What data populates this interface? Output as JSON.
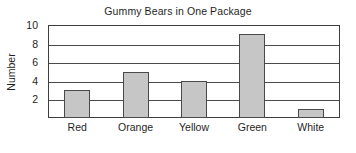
{
  "chart_data": {
    "type": "bar",
    "title": "Gummy Bears in One Package",
    "xlabel": "",
    "ylabel": "Number",
    "categories": [
      "Red",
      "Orange",
      "Yellow",
      "Green",
      "White"
    ],
    "values": [
      3,
      5,
      4,
      9,
      1
    ],
    "ylim": [
      0,
      10
    ],
    "yticks": [
      2,
      4,
      6,
      8,
      10
    ],
    "ytick_labels": [
      "2",
      "4",
      "6",
      "8",
      "10"
    ],
    "grid": "horizontal",
    "legend": "none",
    "bar_fill_color": "#c6c6c6",
    "bar_edge_color": "#4a4a4a",
    "axis_color": "#3d3d3d",
    "background_color": "#ffffff"
  }
}
